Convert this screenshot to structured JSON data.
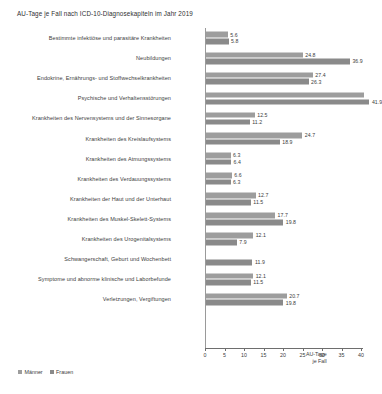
{
  "chart_data": {
    "type": "bar",
    "orientation": "horizontal",
    "title": "AU-Tage je Fall nach ICD-10-Diagnosekapiteln im Jahr 2019",
    "xlabel": "AU-Tage je Fall",
    "xlabel_line1": "AU-Tage",
    "xlabel_line2": "je Fall",
    "ylabel": "",
    "xlim": [
      0,
      41
    ],
    "xticks": [
      0,
      5,
      10,
      15,
      20,
      25,
      30,
      35,
      40
    ],
    "xtick_labels": [
      "0",
      "5",
      "10",
      "15",
      "20",
      "25",
      "30",
      "35",
      "40"
    ],
    "grid": false,
    "legend_position": "bottom-left",
    "categories": [
      "Bestimmte infektiöse und parasitäre Krankheiten",
      "Neubildungen",
      "Endokrine, Ernährungs- und Stoffwechselkrankheiten",
      "Psychische und Verhaltensstörungen",
      "Krankheiten des Nervensystems und der Sinnesorgane",
      "Krankheiten des Kreislaufsystems",
      "Krankheiten des Atmungssystems",
      "Krankheiten des Verdauungssystems",
      "Krankheiten der Haut und der Unterhaut",
      "Krankheiten des Muskel-Skelett-Systems",
      "Krankheiten des Urogenitalsystems",
      "Schwangerschaft, Geburt und Wochenbett",
      "Symptome und abnorme klinische und Laborbefunde",
      "Verletzungen, Vergiftungen"
    ],
    "series": [
      {
        "name": "Männer",
        "color": "#9d9d9d",
        "values": [
          5.6,
          24.8,
          27.4,
          40.6,
          12.5,
          24.7,
          6.3,
          6.6,
          12.7,
          17.7,
          12.1,
          null,
          12.1,
          20.7
        ]
      },
      {
        "name": "Frauen",
        "color": "#8a8a8a",
        "values": [
          5.8,
          36.9,
          26.3,
          41.9,
          11.2,
          18.9,
          6.4,
          6.3,
          11.5,
          19.8,
          7.9,
          11.9,
          11.5,
          19.8
        ]
      }
    ],
    "value_labels": {
      "maenner": [
        "5.6",
        "24.8",
        "27.4",
        "",
        "12.5",
        "24.7",
        "6.3",
        "6.6",
        "12.7",
        "17.7",
        "12.1",
        "",
        "12.1",
        "20.7"
      ],
      "frauen": [
        "5.8",
        "36.9",
        "26.3",
        "41.9",
        "11.2",
        "18.9",
        "6.4",
        "6.3",
        "11.5",
        "19.8",
        "7.9",
        "11.9",
        "11.5",
        "19.8"
      ]
    }
  },
  "legend": {
    "maenner_label": "Männer",
    "frauen_label": "Frauen"
  }
}
